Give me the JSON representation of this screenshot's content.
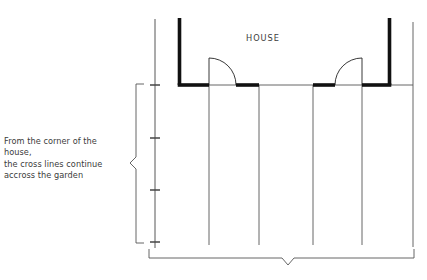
{
  "figure": {
    "type": "floor-plan-diagram",
    "background_color": "#ffffff",
    "wall_color": "#111111",
    "line_color": "#555555",
    "text_color": "#3c3c3c",
    "house_label": "HOUSE",
    "annotation_text": "From the corner of the house,\nthe cross lines continue\naccross the garden"
  },
  "house": {
    "label": "HOUSE",
    "left_wall": {
      "x": 179.5,
      "y_top": 18,
      "y_bottom": 86,
      "thickness": 3.5
    },
    "right_wall": {
      "x": 389.5,
      "y_top": 18,
      "y_bottom": 86,
      "thickness": 3.5
    },
    "front_wall_segments": [
      {
        "x_start": 178,
        "x_end": 209,
        "y": 85,
        "thickness": 3.5
      },
      {
        "x_start": 236,
        "x_end": 259,
        "y": 85,
        "thickness": 3.5
      },
      {
        "x_start": 313,
        "x_end": 335,
        "y": 85,
        "thickness": 3.5
      },
      {
        "x_start": 362,
        "x_end": 391,
        "y": 85,
        "thickness": 3.5
      }
    ],
    "doors": [
      {
        "name": "left-door",
        "hinge_x": 209,
        "leaf_x": 236,
        "y": 85,
        "radius": 27,
        "swing": "right"
      },
      {
        "name": "right-door",
        "hinge_x": 362,
        "leaf_x": 335,
        "y": 85,
        "radius": 27,
        "swing": "left"
      }
    ]
  },
  "garden": {
    "cross_lines": [
      {
        "x": 209,
        "y_top": 85,
        "y_bottom": 245
      },
      {
        "x": 259,
        "y_top": 85,
        "y_bottom": 245
      },
      {
        "x": 313,
        "y_top": 85,
        "y_bottom": 245
      },
      {
        "x": 362,
        "y_top": 85,
        "y_bottom": 245
      },
      {
        "x": 413,
        "y_top": 22,
        "y_bottom": 247
      }
    ],
    "house_front_reference_line": {
      "x_start": 179,
      "x_end": 413,
      "y": 85
    }
  },
  "vertical_ruler": {
    "x": 155,
    "y_top": 19,
    "y_bottom": 248,
    "tick_half_width": 5,
    "tick_positions_y": [
      85,
      138,
      190,
      242
    ]
  },
  "vertical_bracket": {
    "x": 136,
    "y_top": 84,
    "y_bottom": 243,
    "arm_length": 8,
    "notch_y": 163,
    "notch_depth": 6,
    "label": "From the corner of the house,\nthe cross lines continue\naccross the garden"
  },
  "horizontal_bracket": {
    "y": 258,
    "x_start": 149,
    "x_end": 414,
    "arm_length": 9,
    "notch_x": 288,
    "notch_depth": 7
  }
}
